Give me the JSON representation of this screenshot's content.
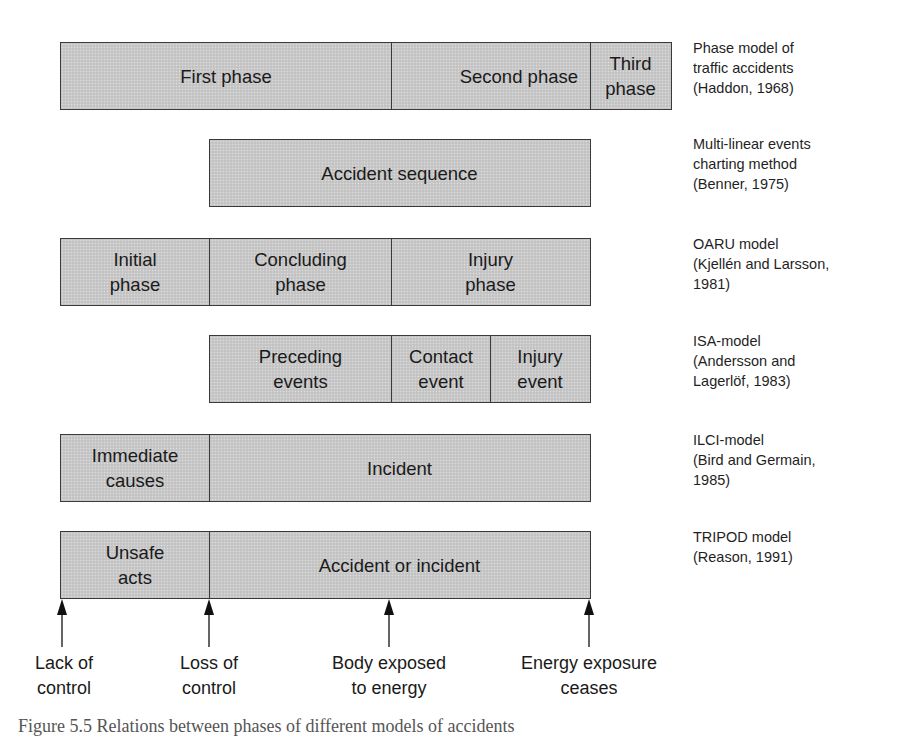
{
  "colors": {
    "block_fill": "#c9c9c9",
    "block_border": "#3a3a3a",
    "text": "#1a1a1a"
  },
  "models": [
    {
      "name": "Phase model of traffic accidents",
      "label": "Phase model of\ntraffic accidents\n(Haddon, 1968)",
      "segments": [
        {
          "text": "First phase"
        },
        {
          "text": "Second phase"
        },
        {
          "text": "Third\nphase"
        }
      ]
    },
    {
      "name": "Multi-linear events charting method",
      "label": "Multi-linear events\ncharting method\n(Benner, 1975)",
      "segments": [
        {
          "text": "Accident sequence"
        }
      ]
    },
    {
      "name": "OARU model",
      "label": "OARU model\n(Kjellén and Larsson,\n1981)",
      "segments": [
        {
          "text": "Initial\nphase"
        },
        {
          "text": "Concluding\nphase"
        },
        {
          "text": "Injury\nphase"
        }
      ]
    },
    {
      "name": "ISA-model",
      "label": "ISA-model\n(Andersson and\nLagerlöf, 1983)",
      "segments": [
        {
          "text": "Preceding\nevents"
        },
        {
          "text": "Contact\nevent"
        },
        {
          "text": "Injury\nevent"
        }
      ]
    },
    {
      "name": "ILCI-model",
      "label": "ILCI-model\n(Bird and Germain,\n1985)",
      "segments": [
        {
          "text": "Immediate\ncauses"
        },
        {
          "text": "Incident"
        }
      ]
    },
    {
      "name": "TRIPOD model",
      "label": "TRIPOD model\n(Reason, 1991)",
      "segments": [
        {
          "text": "Unsafe\nacts"
        },
        {
          "text": "Accident or incident"
        }
      ]
    }
  ],
  "timeline_markers": [
    {
      "icon": "arrow-up-icon",
      "label": "Lack of\ncontrol"
    },
    {
      "icon": "arrow-up-icon",
      "label": "Loss of\ncontrol"
    },
    {
      "icon": "arrow-up-icon",
      "label": "Body exposed\nto energy"
    },
    {
      "icon": "arrow-up-icon",
      "label": "Energy exposure\nceases"
    }
  ],
  "caption": "Figure 5.5  Relations between phases of different models of accidents"
}
